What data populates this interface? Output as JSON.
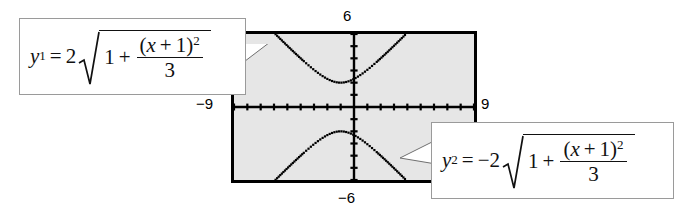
{
  "figure": {
    "type": "graphing-calculator-screenshot"
  },
  "calculator": {
    "window": {
      "xmin_label": "−9",
      "xmax_label": "9",
      "ymin_label": "−6",
      "ymax_label": "6"
    },
    "screen_fill": "#e6e6e6",
    "screen_border": "#000000"
  },
  "callouts": [
    {
      "id": "y1",
      "lhs_var": "y",
      "lhs_sub": "1",
      "equals": "=",
      "coefficient": "2",
      "radicand_first": "1",
      "radicand_op": "+",
      "frac_num_open": "(",
      "frac_num_var": "x",
      "frac_num_op": "+",
      "frac_num_one": "1",
      "frac_num_close": ")",
      "frac_num_exp": "2",
      "frac_den": "3",
      "plain": "y1 = 2 sqrt(1 + (x + 1)^2 / 3)"
    },
    {
      "id": "y2",
      "lhs_var": "y",
      "lhs_sub": "2",
      "equals": "=",
      "coefficient": "−2",
      "radicand_first": "1",
      "radicand_op": "+",
      "frac_num_open": "(",
      "frac_num_var": "x",
      "frac_num_op": "+",
      "frac_num_one": "1",
      "frac_num_close": ")",
      "frac_num_exp": "2",
      "frac_den": "3",
      "plain": "y2 = -2 sqrt(1 + (x + 1)^2 / 3)"
    }
  ],
  "chart_data": {
    "type": "line",
    "title": "",
    "xlabel": "",
    "ylabel": "",
    "xlim": [
      -9,
      9
    ],
    "ylim": [
      -6,
      6
    ],
    "grid": false,
    "axes_origin": [
      0,
      0
    ],
    "x_tick_step": 1,
    "y_tick_step": 1,
    "legend": "none",
    "series": [
      {
        "name": "y1 = 2*sqrt(1 + (x+1)^2/3)",
        "style": "dotted",
        "color": "#000000",
        "x": [
          -6.0,
          -5.5,
          -5.0,
          -4.5,
          -4.0,
          -3.5,
          -3.0,
          -2.5,
          -2.0,
          -1.5,
          -1.0,
          -0.5,
          0.0,
          0.5,
          1.0,
          1.5,
          2.0,
          2.5,
          3.0,
          3.5,
          4.0
        ],
        "y": [
          5.91,
          5.39,
          4.88,
          4.37,
          3.87,
          3.38,
          2.92,
          2.49,
          2.16,
          2.0,
          2.0,
          2.16,
          2.49,
          2.92,
          3.38,
          3.87,
          4.37,
          4.88,
          5.39,
          5.91,
          6.43
        ]
      },
      {
        "name": "y2 = -2*sqrt(1 + (x+1)^2/3)",
        "style": "dotted",
        "color": "#000000",
        "x": [
          -6.0,
          -5.5,
          -5.0,
          -4.5,
          -4.0,
          -3.5,
          -3.0,
          -2.5,
          -2.0,
          -1.5,
          -1.0,
          -0.5,
          0.0,
          0.5,
          1.0,
          1.5,
          2.0,
          2.5,
          3.0,
          3.5,
          4.0
        ],
        "y": [
          -5.91,
          -5.39,
          -4.88,
          -4.37,
          -3.87,
          -3.38,
          -2.92,
          -2.49,
          -2.16,
          -2.0,
          -2.0,
          -2.16,
          -2.49,
          -2.92,
          -3.38,
          -3.87,
          -4.37,
          -4.88,
          -5.39,
          -5.91,
          -6.43
        ]
      }
    ]
  }
}
